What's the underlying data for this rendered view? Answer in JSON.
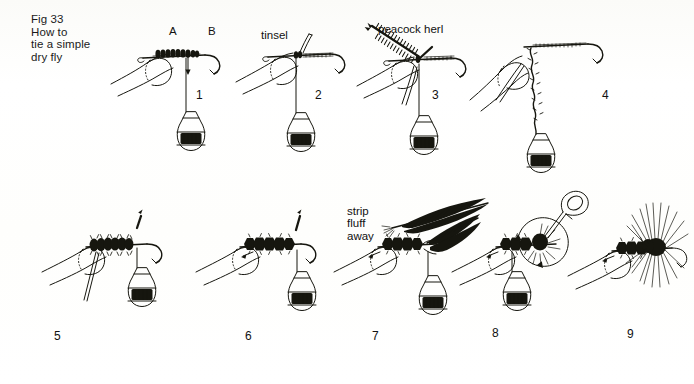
{
  "figure": {
    "caption_title": "Fig 33",
    "caption_body": "How to\ntie a simple\ndry fly",
    "caption_full": "Fig 33\nHow to\ntie a simple\ndry fly",
    "background_color": "#fdfdfb",
    "ink_color": "#16160f"
  },
  "labels": {
    "point_a": "A",
    "point_b": "B",
    "tinsel": "tinsel",
    "peacock_herl": "peacock herl",
    "strip_fluff_away": "strip\nfluff\naway"
  },
  "panels": [
    {
      "number": "1",
      "step_label": "1",
      "row": "top",
      "description": "hand holding hook in fingers, thread wound from A to B along shank, bobbin hanging below"
    },
    {
      "number": "2",
      "step_label": "2",
      "row": "top",
      "description": "tinsel tied in at bend of hook, bobbin hanging"
    },
    {
      "number": "3",
      "step_label": "3",
      "row": "top",
      "description": "peacock herl tied in alongside tinsel"
    },
    {
      "number": "4",
      "step_label": "4",
      "row": "top",
      "description": "herl and thread twisted together into a rope"
    },
    {
      "number": "5",
      "step_label": "5",
      "row": "bottom",
      "description": "herl rope wound up the shank forming the body"
    },
    {
      "number": "6",
      "step_label": "6",
      "row": "bottom",
      "description": "body complete, tinsel rib wound over herl body"
    },
    {
      "number": "7",
      "step_label": "7",
      "row": "bottom",
      "description": "hackle feather tied in at head, fluff stripped away"
    },
    {
      "number": "8",
      "step_label": "8",
      "row": "bottom",
      "description": "hackle wound round hook with hackle pliers, arrow shows winding direction"
    },
    {
      "number": "9",
      "step_label": "9",
      "row": "bottom",
      "description": "finished dry fly with hackle fibres flared"
    }
  ]
}
